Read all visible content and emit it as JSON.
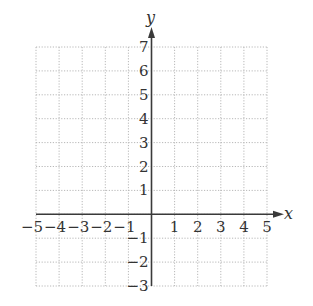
{
  "chart_data": {
    "type": "coordinate-grid",
    "title": "",
    "xlabel": "x",
    "ylabel": "y",
    "xlim": [
      -5,
      5
    ],
    "ylim": [
      -3,
      7
    ],
    "grid": true,
    "grid_style": "dotted",
    "x_ticks": [
      -5,
      -4,
      -3,
      -2,
      -1,
      1,
      2,
      3,
      4,
      5
    ],
    "x_tick_labels": [
      "−5",
      "−4",
      "−3",
      "−2",
      "−1",
      "1",
      "2",
      "3",
      "4",
      "5"
    ],
    "y_ticks": [
      7,
      6,
      5,
      4,
      3,
      2,
      1,
      -1,
      -2,
      -3
    ],
    "y_tick_labels": [
      "7",
      "6",
      "5",
      "4",
      "3",
      "2",
      "1",
      "−1",
      "−2",
      "−3"
    ],
    "series": [],
    "arrows": {
      "x_axis_positive": true,
      "y_axis_positive": true
    }
  },
  "axes": {
    "x_name": "x",
    "y_name": "y"
  },
  "colors": {
    "grid": "#b8b8b8",
    "axis": "#3a3a3a",
    "text": "#333333",
    "background": "#ffffff"
  }
}
